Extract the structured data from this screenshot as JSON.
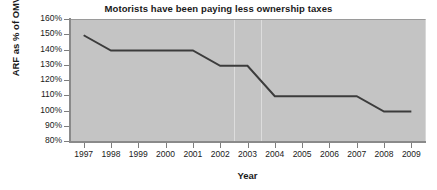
{
  "chart_data": {
    "type": "line",
    "title": "Motorists have been paying less ownership taxes",
    "xlabel": "Year",
    "ylabel": "ARF as % of OMV",
    "x": [
      1997,
      1998,
      1999,
      2000,
      2001,
      2002,
      2003,
      2004,
      2005,
      2006,
      2007,
      2008,
      2009
    ],
    "categories": [
      "1997",
      "1998",
      "1999",
      "2000",
      "2001",
      "2002",
      "2003",
      "2004",
      "2005",
      "2006",
      "2007",
      "2008",
      "2009"
    ],
    "values": [
      150,
      140,
      140,
      140,
      140,
      130,
      130,
      110,
      110,
      110,
      110,
      100,
      100
    ],
    "series": [
      {
        "name": "ARF as % of OMV",
        "values": [
          150,
          140,
          140,
          140,
          140,
          130,
          130,
          110,
          110,
          110,
          110,
          100,
          100
        ],
        "color": "#3c3c3c"
      }
    ],
    "ylim": [
      80,
      160
    ],
    "ytick_values": [
      160,
      150,
      140,
      130,
      120,
      110,
      100,
      90,
      80
    ],
    "ytick_labels": [
      "160%",
      "150%",
      "140%",
      "130%",
      "120%",
      "110%",
      "100%",
      "90%",
      "80%"
    ],
    "xlim": [
      1997,
      2009
    ],
    "grid": "vertical-light",
    "legend": "none",
    "plot_background": "#c4c4c4",
    "line_color": "#3c3c3c",
    "line_width": 2
  },
  "labels": {
    "title": "Motorists have been paying less ownership taxes",
    "y_axis_title": "ARF as % of OMV",
    "x_axis_title": "Year"
  }
}
